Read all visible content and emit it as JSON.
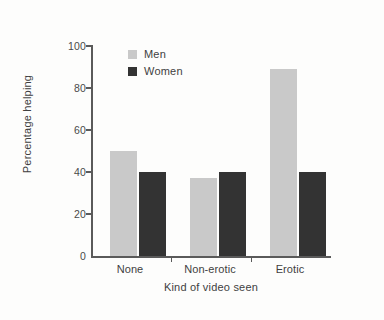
{
  "chart_data": {
    "type": "bar",
    "title": "",
    "xlabel": "Kind of video seen",
    "ylabel": "Percentage helping",
    "categories": [
      "None",
      "Non-erotic",
      "Erotic"
    ],
    "series": [
      {
        "name": "Men",
        "color": "#c9c9c9",
        "values": [
          50,
          37,
          89
        ]
      },
      {
        "name": "Women",
        "color": "#333333",
        "values": [
          40,
          40,
          40
        ]
      }
    ],
    "ylim": [
      0,
      100
    ],
    "yticks": [
      0,
      20,
      40,
      60,
      80,
      100
    ],
    "ytick_labels": [
      "0",
      "20",
      "40",
      "60",
      "80",
      "100"
    ],
    "grid": false,
    "legend_position": "top-left-inside",
    "background_color": "#fdfdfc",
    "axis_color": "#5a5a5a"
  }
}
